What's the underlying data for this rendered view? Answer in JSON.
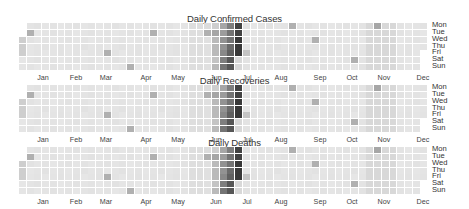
{
  "chart_data": [
    {
      "type": "heatmap",
      "title": "Daily Confirmed Cases",
      "xlabel": "",
      "ylabel": "",
      "weekday_labels": [
        "Mon",
        "Tue",
        "Wed",
        "Thu",
        "Fri",
        "Sat",
        "Sun"
      ],
      "month_labels": [
        "Jan",
        "Feb",
        "Mar",
        "Apr",
        "May",
        "Jun",
        "Jul",
        "Aug",
        "Sep",
        "Oct",
        "Nov",
        "Dec"
      ],
      "weeks": 53,
      "first_weekday_index": 2,
      "colormap": "greys",
      "notable_cells": [
        {
          "week": 1,
          "day": 1,
          "level": 0.3
        },
        {
          "week": 0,
          "day": 2,
          "level": 0.15
        },
        {
          "week": 0,
          "day": 3,
          "level": 0.15
        },
        {
          "week": 0,
          "day": 4,
          "level": 0.15
        },
        {
          "week": 17,
          "day": 1,
          "level": 0.3
        },
        {
          "week": 22,
          "day": 3,
          "level": 0.3
        },
        {
          "week": 11,
          "day": 4,
          "level": 0.3
        },
        {
          "week": 14,
          "day": 6,
          "level": 0.3
        },
        {
          "week": 27,
          "day": 5,
          "level": 0.3
        },
        {
          "week": 25,
          "day": 0,
          "level": 0.2
        },
        {
          "week": 24,
          "day": 1,
          "level": 0.3
        },
        {
          "week": 35,
          "day": 0,
          "level": 0.3
        },
        {
          "week": 38,
          "day": 2,
          "level": 0.3
        },
        {
          "week": 43,
          "day": 5,
          "level": 0.3
        },
        {
          "week": 46,
          "day": 0,
          "level": 0.35
        },
        {
          "week": 29,
          "day": 4,
          "level": 0.2
        }
      ],
      "dark_block": {
        "weeks": [
          26,
          27,
          28
        ],
        "description": "darkest cells early-mid July"
      }
    },
    {
      "type": "heatmap",
      "title": "Daily Recoveries",
      "weekday_labels": [
        "Mon",
        "Tue",
        "Wed",
        "Thu",
        "Fri",
        "Sat",
        "Sun"
      ],
      "month_labels": [
        "Jan",
        "Feb",
        "Mar",
        "Apr",
        "May",
        "Jun",
        "Jul",
        "Aug",
        "Sep",
        "Oct",
        "Nov",
        "Dec"
      ],
      "weeks": 53,
      "colormap": "greys"
    },
    {
      "type": "heatmap",
      "title": "Daily Deaths",
      "weekday_labels": [
        "Mon",
        "Tue",
        "Wed",
        "Thu",
        "Fri",
        "Sat",
        "Sun"
      ],
      "month_labels": [
        "Jan",
        "Feb",
        "Mar",
        "Apr",
        "May",
        "Jun",
        "Jul",
        "Aug",
        "Sep",
        "Oct",
        "Nov",
        "Dec"
      ],
      "weeks": 53,
      "colormap": "greys"
    }
  ],
  "panels": [
    {
      "title": "Daily Confirmed Cases"
    },
    {
      "title": "Daily Recoveries"
    },
    {
      "title": "Daily Deaths"
    }
  ],
  "weekdays": [
    "Mon",
    "Tue",
    "Wed",
    "Thu",
    "Fri",
    "Sat",
    "Sun"
  ],
  "months": [
    "Jan",
    "Feb",
    "Mar",
    "Apr",
    "May",
    "Jun",
    "Jul",
    "Aug",
    "Sep",
    "Oct",
    "Nov",
    "Dec"
  ],
  "month_x": [
    43,
    76,
    106,
    146,
    178,
    216,
    247,
    281,
    320,
    352,
    384,
    423
  ],
  "colors": {
    "base": "#e9e9e9",
    "empty": "#ffffff",
    "dark": "#2a2a2a"
  }
}
